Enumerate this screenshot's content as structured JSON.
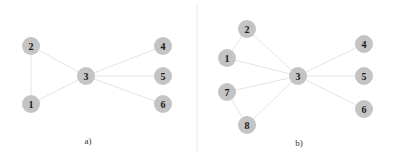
{
  "figure": {
    "colors": {
      "node_fill": "#c4c4c4",
      "node_text": "#1a1a1a",
      "edge": "#e4e4e4",
      "divider": "#ececec",
      "background": "#ffffff"
    },
    "node_radius": 9,
    "divider_x": 197,
    "panels": [
      {
        "caption": "a)",
        "caption_pos": [
          88,
          144
        ],
        "nodes": [
          {
            "id": "1",
            "label": "1",
            "x": 31,
            "y": 104
          },
          {
            "id": "2",
            "label": "2",
            "x": 31,
            "y": 46
          },
          {
            "id": "3",
            "label": "3",
            "x": 86,
            "y": 76
          },
          {
            "id": "4",
            "label": "4",
            "x": 163,
            "y": 46
          },
          {
            "id": "5",
            "label": "5",
            "x": 163,
            "y": 76
          },
          {
            "id": "6",
            "label": "6",
            "x": 163,
            "y": 104
          }
        ],
        "edges": [
          [
            "1",
            "2"
          ],
          [
            "2",
            "3"
          ],
          [
            "1",
            "3"
          ],
          [
            "3",
            "4"
          ],
          [
            "3",
            "5"
          ],
          [
            "3",
            "6"
          ]
        ]
      },
      {
        "caption": "b)",
        "caption_pos": [
          299,
          146
        ],
        "nodes": [
          {
            "id": "1",
            "label": "1",
            "x": 227,
            "y": 58
          },
          {
            "id": "2",
            "label": "2",
            "x": 247,
            "y": 29
          },
          {
            "id": "3",
            "label": "3",
            "x": 298,
            "y": 76
          },
          {
            "id": "4",
            "label": "4",
            "x": 364,
            "y": 44
          },
          {
            "id": "5",
            "label": "5",
            "x": 364,
            "y": 76
          },
          {
            "id": "6",
            "label": "6",
            "x": 364,
            "y": 109
          },
          {
            "id": "7",
            "label": "7",
            "x": 227,
            "y": 92
          },
          {
            "id": "8",
            "label": "8",
            "x": 247,
            "y": 125
          }
        ],
        "edges": [
          [
            "1",
            "2"
          ],
          [
            "2",
            "3"
          ],
          [
            "1",
            "3"
          ],
          [
            "7",
            "3"
          ],
          [
            "7",
            "8"
          ],
          [
            "8",
            "3"
          ],
          [
            "3",
            "4"
          ],
          [
            "3",
            "5"
          ],
          [
            "3",
            "6"
          ]
        ]
      }
    ]
  }
}
